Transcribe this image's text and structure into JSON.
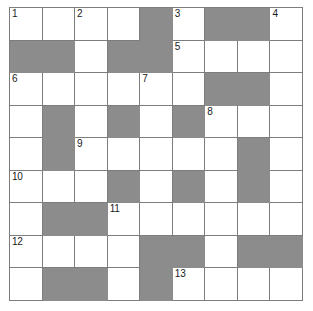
{
  "puzzle": {
    "title": "Crossword Grid",
    "rows": 9,
    "columns": 9,
    "colors": {
      "blocked_cell": "#8c8c8c",
      "open_cell": "#ffffff",
      "grid_line": "#7d7d7d",
      "number_text": "#1a1a1a"
    },
    "cells": [
      [
        {
          "blocked": false,
          "number": "1",
          "letter": ""
        },
        {
          "blocked": false,
          "number": "",
          "letter": ""
        },
        {
          "blocked": false,
          "number": "2",
          "letter": ""
        },
        {
          "blocked": false,
          "number": "",
          "letter": ""
        },
        {
          "blocked": true,
          "number": "",
          "letter": ""
        },
        {
          "blocked": false,
          "number": "3",
          "letter": ""
        },
        {
          "blocked": true,
          "number": "",
          "letter": ""
        },
        {
          "blocked": true,
          "number": "",
          "letter": ""
        },
        {
          "blocked": false,
          "number": "4",
          "letter": ""
        }
      ],
      [
        {
          "blocked": true,
          "number": "",
          "letter": ""
        },
        {
          "blocked": true,
          "number": "",
          "letter": ""
        },
        {
          "blocked": false,
          "number": "",
          "letter": ""
        },
        {
          "blocked": true,
          "number": "",
          "letter": ""
        },
        {
          "blocked": true,
          "number": "",
          "letter": ""
        },
        {
          "blocked": false,
          "number": "5",
          "letter": ""
        },
        {
          "blocked": false,
          "number": "",
          "letter": ""
        },
        {
          "blocked": false,
          "number": "",
          "letter": ""
        },
        {
          "blocked": false,
          "number": "",
          "letter": ""
        }
      ],
      [
        {
          "blocked": false,
          "number": "6",
          "letter": ""
        },
        {
          "blocked": false,
          "number": "",
          "letter": ""
        },
        {
          "blocked": false,
          "number": "",
          "letter": ""
        },
        {
          "blocked": false,
          "number": "",
          "letter": ""
        },
        {
          "blocked": false,
          "number": "7",
          "letter": ""
        },
        {
          "blocked": false,
          "number": "",
          "letter": ""
        },
        {
          "blocked": true,
          "number": "",
          "letter": ""
        },
        {
          "blocked": true,
          "number": "",
          "letter": ""
        },
        {
          "blocked": false,
          "number": "",
          "letter": ""
        }
      ],
      [
        {
          "blocked": false,
          "number": "",
          "letter": ""
        },
        {
          "blocked": true,
          "number": "",
          "letter": ""
        },
        {
          "blocked": false,
          "number": "",
          "letter": ""
        },
        {
          "blocked": true,
          "number": "",
          "letter": ""
        },
        {
          "blocked": false,
          "number": "",
          "letter": ""
        },
        {
          "blocked": true,
          "number": "",
          "letter": ""
        },
        {
          "blocked": false,
          "number": "8",
          "letter": ""
        },
        {
          "blocked": false,
          "number": "",
          "letter": ""
        },
        {
          "blocked": false,
          "number": "",
          "letter": ""
        }
      ],
      [
        {
          "blocked": false,
          "number": "",
          "letter": ""
        },
        {
          "blocked": true,
          "number": "",
          "letter": ""
        },
        {
          "blocked": false,
          "number": "9",
          "letter": ""
        },
        {
          "blocked": false,
          "number": "",
          "letter": ""
        },
        {
          "blocked": false,
          "number": "",
          "letter": ""
        },
        {
          "blocked": false,
          "number": "",
          "letter": ""
        },
        {
          "blocked": false,
          "number": "",
          "letter": ""
        },
        {
          "blocked": true,
          "number": "",
          "letter": ""
        },
        {
          "blocked": false,
          "number": "",
          "letter": ""
        }
      ],
      [
        {
          "blocked": false,
          "number": "10",
          "letter": ""
        },
        {
          "blocked": false,
          "number": "",
          "letter": ""
        },
        {
          "blocked": false,
          "number": "",
          "letter": ""
        },
        {
          "blocked": true,
          "number": "",
          "letter": ""
        },
        {
          "blocked": false,
          "number": "",
          "letter": ""
        },
        {
          "blocked": true,
          "number": "",
          "letter": ""
        },
        {
          "blocked": false,
          "number": "",
          "letter": ""
        },
        {
          "blocked": true,
          "number": "",
          "letter": ""
        },
        {
          "blocked": false,
          "number": "",
          "letter": ""
        }
      ],
      [
        {
          "blocked": false,
          "number": "",
          "letter": ""
        },
        {
          "blocked": true,
          "number": "",
          "letter": ""
        },
        {
          "blocked": true,
          "number": "",
          "letter": ""
        },
        {
          "blocked": false,
          "number": "11",
          "letter": ""
        },
        {
          "blocked": false,
          "number": "",
          "letter": ""
        },
        {
          "blocked": false,
          "number": "",
          "letter": ""
        },
        {
          "blocked": false,
          "number": "",
          "letter": ""
        },
        {
          "blocked": false,
          "number": "",
          "letter": ""
        },
        {
          "blocked": false,
          "number": "",
          "letter": ""
        }
      ],
      [
        {
          "blocked": false,
          "number": "12",
          "letter": ""
        },
        {
          "blocked": false,
          "number": "",
          "letter": ""
        },
        {
          "blocked": false,
          "number": "",
          "letter": ""
        },
        {
          "blocked": false,
          "number": "",
          "letter": ""
        },
        {
          "blocked": true,
          "number": "",
          "letter": ""
        },
        {
          "blocked": true,
          "number": "",
          "letter": ""
        },
        {
          "blocked": false,
          "number": "",
          "letter": ""
        },
        {
          "blocked": true,
          "number": "",
          "letter": ""
        },
        {
          "blocked": true,
          "number": "",
          "letter": ""
        }
      ],
      [
        {
          "blocked": false,
          "number": "",
          "letter": ""
        },
        {
          "blocked": true,
          "number": "",
          "letter": ""
        },
        {
          "blocked": true,
          "number": "",
          "letter": ""
        },
        {
          "blocked": false,
          "number": "",
          "letter": ""
        },
        {
          "blocked": true,
          "number": "",
          "letter": ""
        },
        {
          "blocked": false,
          "number": "13",
          "letter": ""
        },
        {
          "blocked": false,
          "number": "",
          "letter": ""
        },
        {
          "blocked": false,
          "number": "",
          "letter": ""
        },
        {
          "blocked": false,
          "number": "",
          "letter": ""
        }
      ]
    ]
  }
}
